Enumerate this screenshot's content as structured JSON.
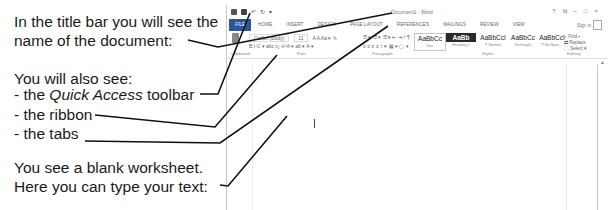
{
  "explanation": {
    "title_bar_line1": "In the title bar you will see the",
    "title_bar_line2": "name of the document:",
    "also_see": "You will also see:",
    "qat_prefix": "- the ",
    "qat_italic": "Quick Access",
    "qat_suffix": " toolbar",
    "ribbon": "- the ribbon",
    "tabs": "- the tabs",
    "blank_line1": "You see a blank worksheet.",
    "blank_line2": "Here you can type your text:"
  },
  "word": {
    "title": "Document1 - Word",
    "quick_access": [
      "save-icon",
      "undo-icon",
      "redo-icon"
    ],
    "window_controls": [
      "?",
      "⧉",
      "–",
      "□",
      "×"
    ],
    "sign_in": "Sign in",
    "tabs": [
      "FILE",
      "HOME",
      "INSERT",
      "DESIGN",
      "PAGE LAYOUT",
      "REFERENCES",
      "MAILINGS",
      "REVIEW",
      "VIEW"
    ],
    "ribbon": {
      "font_name": "Calibri (Body)",
      "font_size": "11",
      "font_row": "A A Aa ▾  ✎",
      "format_row": "B  I  U ▾ abc x₂ x²  A ▾  ab ▾  A ▾",
      "para_row1": "☰ ▾ ☰ ▾ ☰ ▾  ⇤ ⇥  ↕  ¶",
      "para_row2": "≡  ≡  ≡  ≡  ↕ ▾  ▦ ▾  ▢ ▾",
      "groups": [
        "Clipboard",
        "Font",
        "Paragraph",
        "Styles",
        "Editing"
      ],
      "styles": [
        {
          "sample": "AaBbCc",
          "name": "Doc"
        },
        {
          "sample": "AaBb",
          "name": "Heading 2"
        },
        {
          "sample": "AaBbCcI",
          "name": "¶ Normal"
        },
        {
          "sample": "AaBbCc",
          "name": "Verleegd1"
        },
        {
          "sample": "AaBbCcI",
          "name": "¶ No Spac..."
        }
      ],
      "editing": [
        "Find ▾",
        "Replace",
        "Select ▾"
      ]
    }
  }
}
